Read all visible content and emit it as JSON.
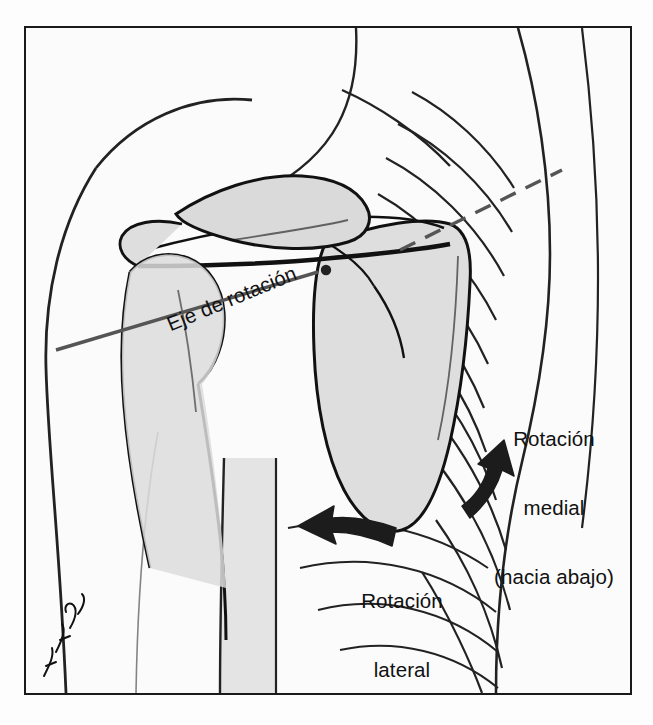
{
  "figure": {
    "kind": "anatomical-illustration",
    "language": "es",
    "frame": {
      "border_color": "#1a1a1a",
      "background_color": "#fbfbfb"
    },
    "palette": {
      "outline": "#111111",
      "bone_fill": "#d9d9d9",
      "bone_fill_light": "#fdfdfd",
      "skin_fill": "#e2e2e2",
      "axis_line": "#4d4d4d",
      "arrow_fill": "#1a1a1a"
    }
  },
  "labels": {
    "axis": "Eje de rotación",
    "medial_line1": "Rotación",
    "medial_line2": "medial",
    "medial_line3": "(hacia abajo)",
    "lateral_line1": "Rotación",
    "lateral_line2": "lateral",
    "lateral_line3": "(hacia arriba)"
  },
  "annotations": {
    "axis_marker": "pivot-dot",
    "medial_arrow": "curved-arrow-up-right",
    "lateral_arrow": "curved-arrow-left"
  },
  "signature": {
    "text": "AK Doz"
  }
}
